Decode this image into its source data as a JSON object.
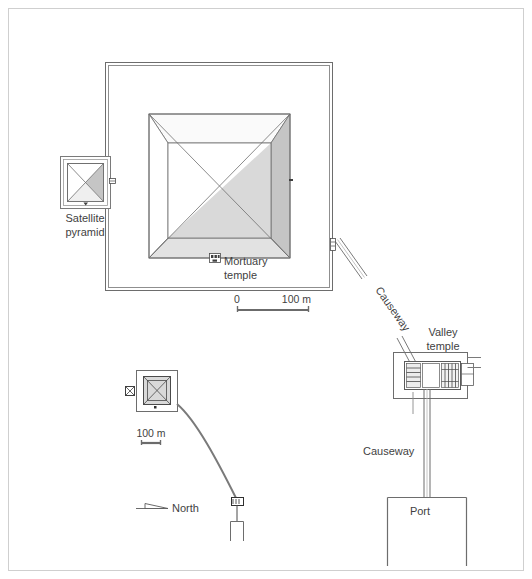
{
  "figure": {
    "kind": "archaeological-site-plan",
    "title_visible": false,
    "background_color": "#ffffff",
    "frame_color": "#c9c9c9",
    "line_color": "#5a5a5a",
    "text_color": "#3f3f3f"
  },
  "labels": {
    "satellite_pyramid_line1": "Satellite",
    "satellite_pyramid_line2": "pyramid",
    "mortuary_temple_line1": "Mortuary",
    "mortuary_temple_line2": "temple",
    "causeway_main": "Causeway",
    "valley_temple_line1": "Valley",
    "valley_temple_line2": "temple",
    "causeway_lower": "Causeway",
    "port": "Port",
    "north": "North"
  },
  "scale_bars": [
    {
      "name": "main-scale-bar",
      "start_label": "0",
      "end_label": "100 m",
      "length_px": 72
    },
    {
      "name": "inset-scale-bar",
      "start_label": "",
      "end_label": "100 m",
      "length_px": 20
    }
  ],
  "shading": {
    "face_north": "#fbfbfb",
    "face_west": "#ffffff",
    "face_south": "#e3e3e3",
    "face_east": "#c6c6c6",
    "satellite_face": "#c6c6c6",
    "inset_fill": "#d9d9d9",
    "chamber_fill": "#d2d2d2",
    "chamber_light": "#ececec"
  },
  "structures": [
    {
      "name": "enclosure-wall",
      "description": "double-line rectangular enclosure wall around main pyramid"
    },
    {
      "name": "main-pyramid",
      "description": "square pyramid plan, outer square with diagonals and inner square"
    },
    {
      "name": "satellite-pyramid",
      "description": "small square pyramid with diagonals west of main pyramid"
    },
    {
      "name": "mortuary-temple",
      "description": "small chambered structure at south face of main pyramid"
    },
    {
      "name": "causeway",
      "description": "double-line ramp running southeast from enclosure to valley temple"
    },
    {
      "name": "valley-temple",
      "description": "rectangular temple with internal hatched chambers"
    },
    {
      "name": "port",
      "description": "U-shaped harbour basin south of the valley temple"
    },
    {
      "name": "inset-overview",
      "description": "small-scale overview of whole complex at lower left"
    },
    {
      "name": "north-arrow",
      "description": "flat triangular north indicator pointing right"
    }
  ]
}
